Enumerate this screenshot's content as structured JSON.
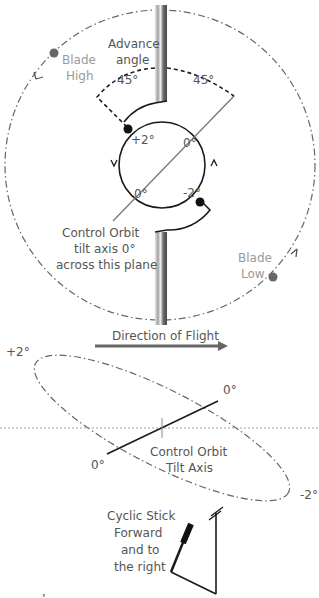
{
  "colors": {
    "line": "#1a1a1a",
    "gray_line": "#777777",
    "blade_dot": "#666666",
    "shaft_dark": "#555555",
    "shaft_light": "#cfcfcf",
    "text": "#555555",
    "text_light": "#9a9a9a"
  },
  "top_view": {
    "advance_angle_label": [
      "Advance",
      "angle"
    ],
    "angle_left": "45°",
    "angle_right": "45°",
    "blade_high_label": [
      "Blade",
      "High"
    ],
    "blade_low_label": [
      "Blade",
      "Low"
    ],
    "point_plus2": "+2°",
    "point_minus2": "-2°",
    "zero_upper": "0°",
    "zero_lower": "0°",
    "tilt_axis_label": [
      "Control Orbit",
      "tilt axis 0°",
      "across this plane"
    ]
  },
  "direction_label": "Direction of Flight",
  "side_view": {
    "plus2": "+2°",
    "minus2": "-2°",
    "zero_right": "0°",
    "zero_left": "0°",
    "axis_label": [
      "Control Orbit",
      "Tilt Axis"
    ]
  },
  "stick": {
    "label": [
      "Cyclic Stick",
      "Forward",
      "and to",
      "the right"
    ]
  },
  "footnote": ","
}
